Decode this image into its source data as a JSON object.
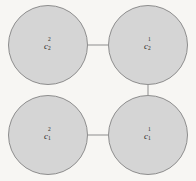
{
  "figure": {
    "title": "",
    "background_color": "#f7f6f3",
    "node_fill_color": "#d5d5d5",
    "node_stroke_color": "#8d8d8d",
    "edge_color": "#8d8d8d"
  },
  "nodes": [
    {
      "id": "top-left",
      "base": "c",
      "superscript": "2",
      "subscript": "2",
      "cx": 48,
      "cy": 45,
      "r": 40
    },
    {
      "id": "top-right",
      "base": "c",
      "superscript": "1",
      "subscript": "2",
      "cx": 148,
      "cy": 45,
      "r": 40
    },
    {
      "id": "bottom-left",
      "base": "c",
      "superscript": "2",
      "subscript": "1",
      "cx": 48,
      "cy": 135,
      "r": 40
    },
    {
      "id": "bottom-right",
      "base": "c",
      "superscript": "1",
      "subscript": "1",
      "cx": 148,
      "cy": 135,
      "r": 40
    }
  ],
  "edges": [
    {
      "id": "edge-top",
      "from": "top-left",
      "to": "top-right",
      "x1": 88,
      "y1": 45,
      "x2": 108,
      "y2": 45
    },
    {
      "id": "edge-bottom",
      "from": "bottom-left",
      "to": "bottom-right",
      "x1": 88,
      "y1": 135,
      "x2": 108,
      "y2": 135
    },
    {
      "id": "edge-right",
      "from": "top-right",
      "to": "bottom-right",
      "x1": 148,
      "y1": 85,
      "x2": 148,
      "y2": 95
    }
  ]
}
